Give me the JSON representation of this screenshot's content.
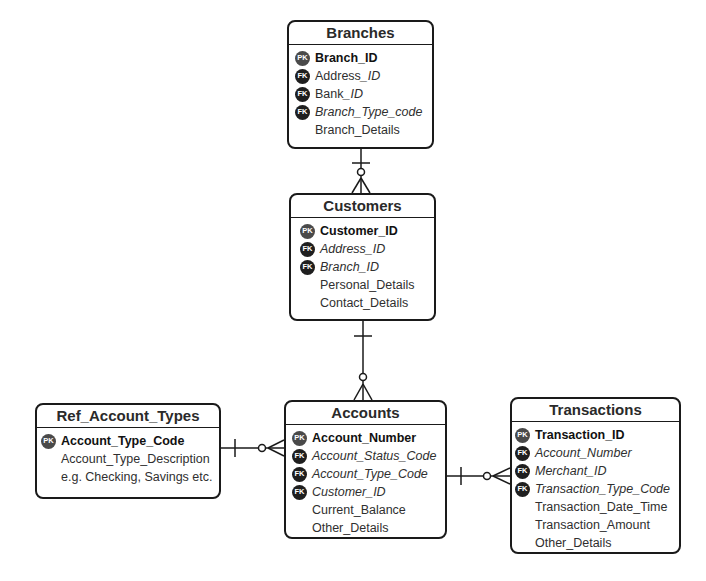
{
  "entities": {
    "branches": {
      "title": "Branches",
      "fields": [
        {
          "key": "PK",
          "name": "Branch_ID"
        },
        {
          "key": "FK",
          "name_plain": "Address",
          "name_italic": "_ID"
        },
        {
          "key": "FK",
          "name_plain": "Bank",
          "name_italic": "_ID"
        },
        {
          "key": "FK",
          "name_italic": "Branch_Type_code"
        },
        {
          "key": "",
          "name": "Branch_Details"
        }
      ]
    },
    "customers": {
      "title": "Customers",
      "fields": [
        {
          "key": "PK",
          "name": "Customer_ID"
        },
        {
          "key": "FK",
          "name_italic": "Address_ID"
        },
        {
          "key": "FK",
          "name_italic": "Branch_ID"
        },
        {
          "key": "",
          "name": "Personal_Details"
        },
        {
          "key": "",
          "name": "Contact_Details"
        }
      ]
    },
    "ref_account_types": {
      "title": "Ref_Account_Types",
      "fields": [
        {
          "key": "PK",
          "name": "Account_Type_Code"
        },
        {
          "key": "",
          "name": "Account_Type_Description"
        },
        {
          "key": "",
          "name": "e.g. Checking, Savings etc."
        }
      ]
    },
    "accounts": {
      "title": "Accounts",
      "fields": [
        {
          "key": "PK",
          "name": "Account_Number"
        },
        {
          "key": "FK",
          "name_italic": "Account_Status_Code"
        },
        {
          "key": "FK",
          "name_italic": "Account_Type_Code"
        },
        {
          "key": "FK",
          "name_italic": "Customer_ID"
        },
        {
          "key": "",
          "name": "Current_Balance"
        },
        {
          "key": "",
          "name": "Other_Details"
        }
      ]
    },
    "transactions": {
      "title": "Transactions",
      "fields": [
        {
          "key": "PK",
          "name": "Transaction_ID"
        },
        {
          "key": "FK",
          "name_italic": "Account_Number"
        },
        {
          "key": "FK",
          "name_italic": "Merchant_ID"
        },
        {
          "key": "FK",
          "name_italic": "Transaction_Type_Code"
        },
        {
          "key": "",
          "name": "Transaction_Date_Time"
        },
        {
          "key": "",
          "name": "Transaction_Amount"
        },
        {
          "key": "",
          "name": "Other_Details"
        }
      ]
    }
  },
  "relationships": [
    {
      "from": "Branches",
      "to": "Customers",
      "cardinality": "one-to-zero-or-many"
    },
    {
      "from": "Customers",
      "to": "Accounts",
      "cardinality": "one-to-zero-or-many"
    },
    {
      "from": "Ref_Account_Types",
      "to": "Accounts",
      "cardinality": "one-to-zero-or-many"
    },
    {
      "from": "Accounts",
      "to": "Transactions",
      "cardinality": "one-to-zero-or-many"
    }
  ]
}
